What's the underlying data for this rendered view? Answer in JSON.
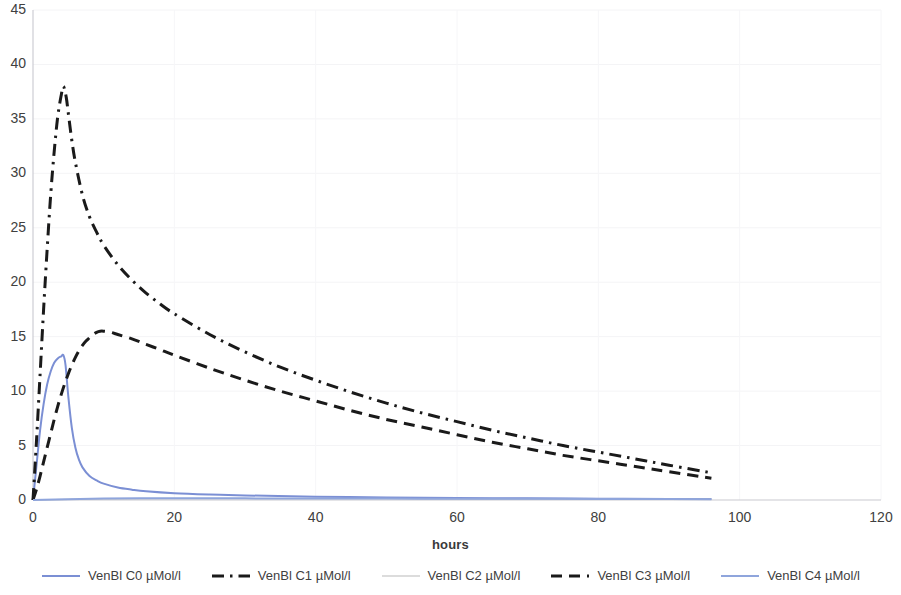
{
  "chart_data": {
    "type": "line",
    "title": "",
    "xlabel": "hours",
    "ylabel": "",
    "xlim": [
      0,
      120
    ],
    "ylim": [
      0,
      45
    ],
    "xticks": [
      0,
      20,
      40,
      60,
      80,
      100,
      120
    ],
    "yticks": [
      0,
      5,
      10,
      15,
      20,
      25,
      30,
      35,
      40,
      45
    ],
    "grid": "faint-horizontal-and-vertical",
    "legend_position": "bottom",
    "series": [
      {
        "name": "VenBl C0 µMol/l",
        "style": "solid",
        "color": "#7B8FD4",
        "points": [
          [
            0,
            0.0
          ],
          [
            0.5,
            3.2
          ],
          [
            1.0,
            6.4
          ],
          [
            1.5,
            8.8
          ],
          [
            2.0,
            10.6
          ],
          [
            2.5,
            11.8
          ],
          [
            3.0,
            12.6
          ],
          [
            3.5,
            13.0
          ],
          [
            4.0,
            13.2
          ],
          [
            4.3,
            13.3
          ],
          [
            4.6,
            12.4
          ],
          [
            5.0,
            9.5
          ],
          [
            5.5,
            6.6
          ],
          [
            6.0,
            4.8
          ],
          [
            6.5,
            3.7
          ],
          [
            7.0,
            3.0
          ],
          [
            8.0,
            2.2
          ],
          [
            9.0,
            1.8
          ],
          [
            10.0,
            1.5
          ],
          [
            12.0,
            1.15
          ],
          [
            14.0,
            0.95
          ],
          [
            16.0,
            0.8
          ],
          [
            20.0,
            0.62
          ],
          [
            25.0,
            0.5
          ],
          [
            30.0,
            0.42
          ],
          [
            40.0,
            0.3
          ],
          [
            50.0,
            0.24
          ],
          [
            60.0,
            0.19
          ],
          [
            70.0,
            0.15
          ],
          [
            80.0,
            0.12
          ],
          [
            90.0,
            0.1
          ],
          [
            96.0,
            0.09
          ]
        ]
      },
      {
        "name": "VenBl C1 µMol/l",
        "style": "dashdot",
        "color": "#1a1a1a",
        "points": [
          [
            0,
            0.0
          ],
          [
            0.5,
            5.5
          ],
          [
            1.0,
            11.5
          ],
          [
            1.5,
            17.5
          ],
          [
            2.0,
            23.0
          ],
          [
            2.5,
            28.0
          ],
          [
            3.0,
            32.0
          ],
          [
            3.5,
            35.2
          ],
          [
            4.0,
            37.2
          ],
          [
            4.3,
            38.0
          ],
          [
            4.7,
            37.0
          ],
          [
            5.0,
            35.5
          ],
          [
            5.5,
            33.0
          ],
          [
            6.0,
            31.0
          ],
          [
            7.0,
            28.0
          ],
          [
            8.0,
            26.0
          ],
          [
            9.0,
            24.6
          ],
          [
            10.0,
            23.4
          ],
          [
            12.0,
            21.6
          ],
          [
            14.0,
            20.2
          ],
          [
            16.0,
            19.0
          ],
          [
            18.0,
            18.0
          ],
          [
            20.0,
            17.1
          ],
          [
            25.0,
            15.2
          ],
          [
            30.0,
            13.6
          ],
          [
            35.0,
            12.2
          ],
          [
            40.0,
            11.0
          ],
          [
            45.0,
            9.9
          ],
          [
            50.0,
            8.9
          ],
          [
            55.0,
            8.0
          ],
          [
            60.0,
            7.2
          ],
          [
            65.0,
            6.4
          ],
          [
            70.0,
            5.7
          ],
          [
            75.0,
            5.0
          ],
          [
            80.0,
            4.4
          ],
          [
            85.0,
            3.8
          ],
          [
            90.0,
            3.2
          ],
          [
            96.0,
            2.5
          ]
        ]
      },
      {
        "name": "VenBl C2 µMol/l",
        "style": "solid-thin",
        "color": "#B9B9B9",
        "points": [
          [
            0,
            0.0
          ],
          [
            5,
            0.06
          ],
          [
            10,
            0.1
          ],
          [
            20,
            0.12
          ],
          [
            40,
            0.12
          ],
          [
            60,
            0.11
          ],
          [
            80,
            0.1
          ],
          [
            96,
            0.09
          ]
        ]
      },
      {
        "name": "VenBl C3 µMol/l",
        "style": "dashed",
        "color": "#1a1a1a",
        "points": [
          [
            0,
            0.0
          ],
          [
            0.5,
            1.0
          ],
          [
            1.0,
            2.2
          ],
          [
            1.5,
            3.5
          ],
          [
            2.0,
            4.8
          ],
          [
            2.5,
            6.1
          ],
          [
            3.0,
            7.4
          ],
          [
            3.5,
            8.6
          ],
          [
            4.0,
            9.7
          ],
          [
            4.5,
            10.7
          ],
          [
            5.0,
            11.6
          ],
          [
            5.5,
            12.4
          ],
          [
            6.0,
            13.1
          ],
          [
            6.5,
            13.7
          ],
          [
            7.0,
            14.2
          ],
          [
            7.5,
            14.6
          ],
          [
            8.0,
            14.9
          ],
          [
            8.5,
            15.2
          ],
          [
            9.0,
            15.4
          ],
          [
            9.5,
            15.5
          ],
          [
            10.0,
            15.5
          ],
          [
            11.0,
            15.4
          ],
          [
            12.0,
            15.2
          ],
          [
            14.0,
            14.8
          ],
          [
            16.0,
            14.3
          ],
          [
            18.0,
            13.8
          ],
          [
            20.0,
            13.3
          ],
          [
            25.0,
            12.1
          ],
          [
            30.0,
            11.0
          ],
          [
            35.0,
            10.0
          ],
          [
            40.0,
            9.1
          ],
          [
            45.0,
            8.2
          ],
          [
            50.0,
            7.4
          ],
          [
            55.0,
            6.7
          ],
          [
            60.0,
            6.0
          ],
          [
            65.0,
            5.3
          ],
          [
            70.0,
            4.7
          ],
          [
            75.0,
            4.1
          ],
          [
            80.0,
            3.6
          ],
          [
            85.0,
            3.1
          ],
          [
            90.0,
            2.6
          ],
          [
            96.0,
            2.0
          ]
        ]
      },
      {
        "name": "VenBl C4 µMol/l",
        "style": "solid",
        "color": "#8FA5DC",
        "points": [
          [
            0,
            0.0
          ],
          [
            5,
            0.08
          ],
          [
            10,
            0.14
          ],
          [
            15,
            0.16
          ],
          [
            20,
            0.16
          ],
          [
            30,
            0.15
          ],
          [
            40,
            0.14
          ],
          [
            50,
            0.13
          ],
          [
            60,
            0.12
          ],
          [
            70,
            0.11
          ],
          [
            80,
            0.1
          ],
          [
            90,
            0.09
          ],
          [
            96,
            0.08
          ]
        ]
      }
    ]
  },
  "axis": {
    "x_title": "hours",
    "x_tick_labels": [
      "0",
      "20",
      "40",
      "60",
      "80",
      "100",
      "120"
    ],
    "y_tick_labels": [
      "0",
      "5",
      "10",
      "15",
      "20",
      "25",
      "30",
      "35",
      "40",
      "45"
    ]
  },
  "legend": {
    "items": [
      {
        "label": "VenBl C0 µMol/l",
        "color": "#7B8FD4",
        "style": "solid"
      },
      {
        "label": "VenBl C1 µMol/l",
        "color": "#1a1a1a",
        "style": "dashdot"
      },
      {
        "label": "VenBl C2 µMol/l",
        "color": "#B9B9B9",
        "style": "solid-thin"
      },
      {
        "label": "VenBl C3 µMol/l",
        "color": "#1a1a1a",
        "style": "dashed"
      },
      {
        "label": "VenBl C4 µMol/l",
        "color": "#8FA5DC",
        "style": "solid"
      }
    ]
  }
}
